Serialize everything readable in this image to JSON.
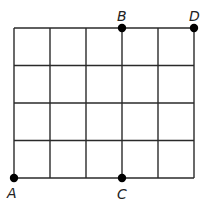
{
  "diagram": {
    "type": "grid",
    "columns": 5,
    "rows": 4,
    "grid_color": "#2a2a2a",
    "point_color": "#000000",
    "points": [
      {
        "label": "A",
        "col": 0,
        "row": 4
      },
      {
        "label": "B",
        "col": 3,
        "row": 0
      },
      {
        "label": "C",
        "col": 3,
        "row": 4
      },
      {
        "label": "D",
        "col": 5,
        "row": 0
      }
    ]
  }
}
